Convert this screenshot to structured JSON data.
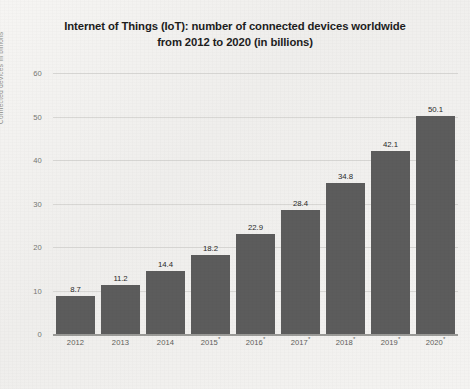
{
  "chart_data": {
    "type": "bar",
    "title": "Internet of Things (IoT): number of connected devices worldwide from 2012 to 2020 (in billions)",
    "title_lines": [
      "Internet of Things (IoT): number of connected devices worldwide",
      "from 2012 to 2020 (in billions)"
    ],
    "categories": [
      "2012",
      "2013",
      "2014",
      "2015*",
      "2016*",
      "2017*",
      "2018*",
      "2019*",
      "2020*"
    ],
    "category_bases": [
      "2012",
      "2013",
      "2014",
      "2015",
      "2016",
      "2017",
      "2018",
      "2019",
      "2020"
    ],
    "category_marks": [
      "",
      "",
      "",
      "*",
      "*",
      "*",
      "*",
      "*",
      "*"
    ],
    "values": [
      8.7,
      11.2,
      14.4,
      18.2,
      22.9,
      28.4,
      34.8,
      42.1,
      50.1
    ],
    "value_labels": [
      "8.7",
      "11.2",
      "14.4",
      "18.2",
      "22.9",
      "28.4",
      "34.8",
      "42.1",
      "50.1"
    ],
    "xlabel": "",
    "ylabel": "Connected devices in billions",
    "ylim": [
      0,
      60
    ],
    "yticks": [
      0,
      10,
      20,
      30,
      40,
      50,
      60
    ],
    "ytick_labels": [
      "0",
      "10",
      "20",
      "30",
      "40",
      "50",
      "60"
    ],
    "grid": true,
    "legend": false,
    "series_color": "#5c5c5c",
    "gridline_color": "#d8d7d4",
    "background_color": "#f2f1ef",
    "text_color": "#1d1d1d"
  }
}
